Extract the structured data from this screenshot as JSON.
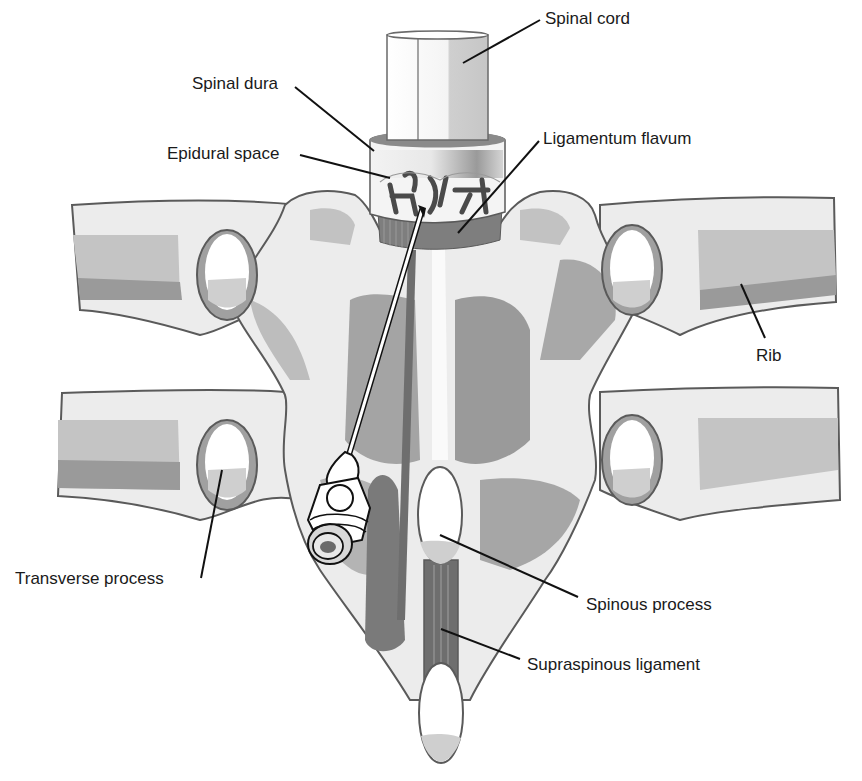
{
  "figure": {
    "colors": {
      "background": "#ffffff",
      "outline": "#5a5a5a",
      "bone_light": "#ececec",
      "tone_mid": "#c2c2c2",
      "tone_dark": "#8e8e8e",
      "tone_darker": "#6e6e6e",
      "leader_line": "#111111",
      "label_text": "#1a1a1a"
    }
  },
  "labels": {
    "spinal_cord": "Spinal cord",
    "spinal_dura": "Spinal dura",
    "ligamentum_flavum": "Ligamentum flavum",
    "epidural_space": "Epidural space",
    "rib": "Rib",
    "transverse_process": "Transverse process",
    "spinous_process": "Spinous process",
    "supraspinous_ligament": "Supraspinous ligament"
  },
  "annotations": [
    {
      "key": "spinal_cord",
      "text_pos": [
        545,
        10
      ],
      "line": [
        [
          540,
          20
        ],
        [
          463,
          63
        ]
      ]
    },
    {
      "key": "spinal_dura",
      "text_pos": [
        192,
        75
      ],
      "line": [
        [
          295,
          87
        ],
        [
          374,
          151
        ]
      ]
    },
    {
      "key": "ligamentum_flavum",
      "text_pos": [
        543,
        130
      ],
      "line": [
        [
          539,
          141
        ],
        [
          458,
          233
        ]
      ]
    },
    {
      "key": "epidural_space",
      "text_pos": [
        167,
        145
      ],
      "line": [
        [
          300,
          155
        ],
        [
          390,
          178
        ]
      ]
    },
    {
      "key": "rib",
      "text_pos": [
        756,
        347
      ],
      "line": [
        [
          765,
          338
        ],
        [
          741,
          284
        ]
      ]
    },
    {
      "key": "transverse_process",
      "text_pos": [
        15,
        570
      ],
      "line": [
        [
          201,
          578
        ],
        [
          222,
          470
        ]
      ]
    },
    {
      "key": "spinous_process",
      "text_pos": [
        586,
        596
      ],
      "line": [
        [
          578,
          597
        ],
        [
          440,
          535
        ]
      ]
    },
    {
      "key": "supraspinous_ligament",
      "text_pos": [
        527,
        656
      ],
      "line": [
        [
          520,
          659
        ],
        [
          441,
          629
        ]
      ]
    }
  ]
}
